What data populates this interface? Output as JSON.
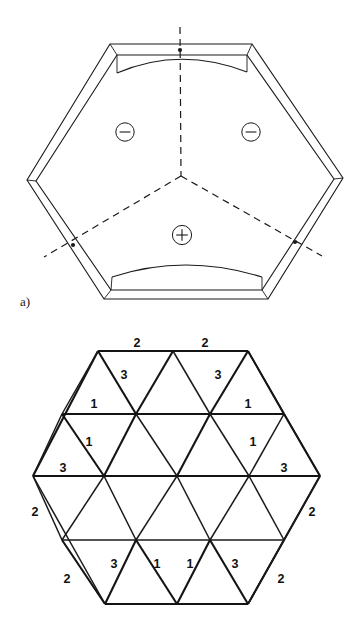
{
  "figure": {
    "panel_a": {
      "label": "a)",
      "domain_signs": [
        {
          "name": "minus-left",
          "symbol": "−",
          "cx": 125,
          "cy": 132
        },
        {
          "name": "minus-right",
          "symbol": "−",
          "cx": 251,
          "cy": 132
        },
        {
          "name": "plus-bottom",
          "symbol": "+",
          "cx": 182,
          "cy": 235
        }
      ],
      "hexagon_vertices": [
        {
          "x": 180,
          "y": 50
        },
        {
          "x": 253,
          "y": 51
        },
        {
          "x": 335,
          "y": 180
        },
        {
          "x": 262,
          "y": 291
        },
        {
          "x": 111,
          "y": 291
        },
        {
          "x": 34,
          "y": 181
        }
      ],
      "domain_wall_nodes": [
        {
          "x": 180,
          "y": 50
        },
        {
          "x": 73,
          "y": 246
        },
        {
          "x": 296,
          "y": 243
        },
        {
          "x": 181,
          "y": 176
        }
      ]
    },
    "panel_b": {
      "edge_indices": [
        {
          "label": "2",
          "x": 137,
          "y": 346,
          "name": "index-top-left"
        },
        {
          "label": "2",
          "x": 205,
          "y": 346,
          "name": "index-top-right"
        },
        {
          "label": "3",
          "x": 124,
          "y": 374,
          "name": "index-upper-left-inner"
        },
        {
          "label": "3",
          "x": 218,
          "y": 374,
          "name": "index-upper-right-inner"
        },
        {
          "label": "1",
          "x": 94,
          "y": 406,
          "name": "index-left-row1"
        },
        {
          "label": "1",
          "x": 248,
          "y": 406,
          "name": "index-right-row1"
        },
        {
          "label": "1",
          "x": 89,
          "y": 444,
          "name": "index-left-row2"
        },
        {
          "label": "1",
          "x": 253,
          "y": 444,
          "name": "index-right-row2"
        },
        {
          "label": "3",
          "x": 63,
          "y": 470,
          "name": "index-left-mid"
        },
        {
          "label": "3",
          "x": 284,
          "y": 470,
          "name": "index-right-mid"
        },
        {
          "label": "2",
          "x": 35,
          "y": 513,
          "name": "index-left-lower"
        },
        {
          "label": "2",
          "x": 312,
          "y": 513,
          "name": "index-right-lower"
        },
        {
          "label": "3",
          "x": 114,
          "y": 565,
          "name": "index-bottom-left-inner"
        },
        {
          "label": "1",
          "x": 157,
          "y": 565,
          "name": "index-bottom-center-left"
        },
        {
          "label": "1",
          "x": 190,
          "y": 565,
          "name": "index-bottom-center-right"
        },
        {
          "label": "3",
          "x": 235,
          "y": 565,
          "name": "index-bottom-right-inner"
        },
        {
          "label": "2",
          "x": 67,
          "y": 579,
          "name": "index-bottom-left-outer"
        },
        {
          "label": "2",
          "x": 281,
          "y": 579,
          "name": "index-bottom-right-outer"
        }
      ],
      "hexagon_vertices": [
        {
          "x": 98,
          "y": 351
        },
        {
          "x": 248,
          "y": 351
        },
        {
          "x": 320,
          "y": 476
        },
        {
          "x": 248,
          "y": 604
        },
        {
          "x": 105,
          "y": 604
        },
        {
          "x": 33,
          "y": 476
        }
      ],
      "triangle_rows": 4,
      "lattice_description": "triangular lattice tiling of hexagon"
    },
    "colors": {
      "ink": "#1a1a1a",
      "background": "#ffffff"
    }
  }
}
